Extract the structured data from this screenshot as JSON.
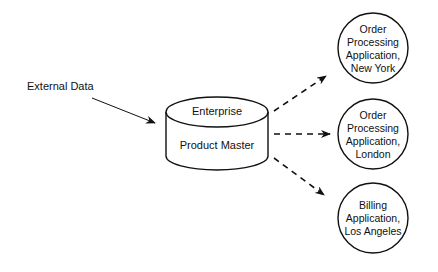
{
  "diagram": {
    "source": {
      "label": "External Data"
    },
    "database": {
      "top_label": "Enterprise",
      "body_label": "Product Master",
      "shape": "cylinder"
    },
    "targets": [
      {
        "lines": [
          "Order",
          "Processing",
          "Application,",
          "New York"
        ],
        "shape": "circle"
      },
      {
        "lines": [
          "Order",
          "Processing",
          "Application,",
          "London"
        ],
        "shape": "circle"
      },
      {
        "lines": [
          "Billing",
          "Application,",
          "Los Angeles"
        ],
        "shape": "circle"
      }
    ],
    "connectors": [
      {
        "from": "External Data",
        "to": "Enterprise Product Master",
        "style": "solid-arrow"
      },
      {
        "from": "Enterprise Product Master",
        "to": "Order Processing Application, New York",
        "style": "dashed-arrow"
      },
      {
        "from": "Enterprise Product Master",
        "to": "Order Processing Application, London",
        "style": "dashed-arrow"
      },
      {
        "from": "Enterprise Product Master",
        "to": "Billing Application, Los Angeles",
        "style": "dashed-arrow"
      }
    ],
    "colors": {
      "stroke": "#111111",
      "background": "#ffffff"
    }
  }
}
